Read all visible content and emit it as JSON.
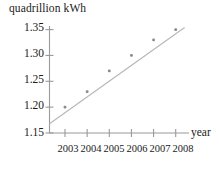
{
  "chart_data": {
    "type": "scatter",
    "title": "",
    "subtitle": "",
    "xlabel": "year",
    "ylabel": "quadrillion kWh",
    "x": [
      2003,
      2004,
      2005,
      2006,
      2007,
      2008
    ],
    "values": [
      1.2,
      1.23,
      1.27,
      1.3,
      1.33,
      1.35
    ],
    "series": [
      {
        "name": "electricity",
        "values": [
          1.2,
          1.23,
          1.27,
          1.3,
          1.33,
          1.35
        ]
      },
      {
        "name": "trend line",
        "type": "line",
        "endpoints": [
          [
            2002.3,
            1.168
          ],
          [
            2008.4,
            1.354
          ]
        ]
      }
    ],
    "xlim": [
      2002.3,
      2008.6
    ],
    "ylim": [
      1.15,
      1.355
    ],
    "xticks": [
      2003,
      2004,
      2005,
      2006,
      2007,
      2008
    ],
    "xticklabels": [
      "2003",
      "2004",
      "2005",
      "2006",
      "2007",
      "2008"
    ],
    "yticks": [
      1.15,
      1.2,
      1.25,
      1.3,
      1.35
    ],
    "yticklabels": [
      "1.15",
      "1.20",
      "1.25",
      "1.30",
      "1.35"
    ],
    "grid": false,
    "legend": null,
    "colors": {
      "axis": "#9a9a9a",
      "marker": "#8c8c8c",
      "line": "#b5b5b5",
      "text": "#1a1a1a",
      "background": "#ffffff"
    }
  }
}
